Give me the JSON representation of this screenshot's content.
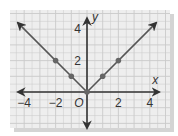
{
  "chart_data": {
    "type": "line",
    "title": "",
    "function": "y = |x|",
    "xlabel": "x",
    "ylabel": "y",
    "origin_label": "O",
    "xlim": [
      -4.5,
      4.5
    ],
    "ylim": [
      -2,
      5
    ],
    "x_ticks": [
      "-4",
      "-2",
      "2",
      "4"
    ],
    "y_ticks": [
      "2",
      "4"
    ],
    "grid": true,
    "series": [
      {
        "name": "y=|x|",
        "x": [
          -4.3,
          -2,
          -1,
          0,
          1,
          2,
          4.3
        ],
        "y": [
          4.3,
          2,
          1,
          0,
          1,
          2,
          4.3
        ]
      }
    ],
    "points": [
      {
        "x": -2,
        "y": 2
      },
      {
        "x": -1,
        "y": 1
      },
      {
        "x": 0,
        "y": 0
      },
      {
        "x": 1,
        "y": 1
      },
      {
        "x": 2,
        "y": 2
      }
    ]
  },
  "colors": {
    "grid": "#c9c9c9",
    "grid_bg": "#ececec",
    "line": "#555555",
    "point": "#666666",
    "axis": "#333333"
  }
}
